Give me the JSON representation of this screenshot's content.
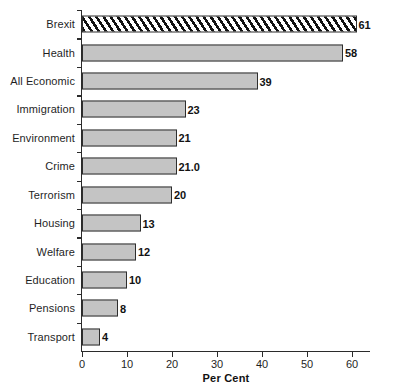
{
  "chart_data": {
    "type": "bar",
    "orientation": "horizontal",
    "title": "",
    "xlabel": "Per Cent",
    "ylabel": "",
    "categories": [
      "Brexit",
      "Health",
      "All Economic",
      "Immigration",
      "Environment",
      "Crime",
      "Terrorism",
      "Housing",
      "Welfare",
      "Education",
      "Pensions",
      "Transport"
    ],
    "values": [
      61,
      58,
      39,
      23,
      21,
      21.0,
      20,
      13,
      12,
      10,
      8,
      4
    ],
    "value_labels": [
      "61",
      "58",
      "39",
      "23",
      "21",
      "21.0",
      "20",
      "13",
      "12",
      "10",
      "8",
      "4"
    ],
    "xlim": [
      0,
      64
    ],
    "xticks": [
      0,
      10,
      20,
      30,
      40,
      50,
      60
    ],
    "xtick_labels": [
      "0",
      "10",
      "20",
      "30",
      "40",
      "50",
      "60"
    ],
    "grid": false,
    "legend": null,
    "bar_styles": [
      "hatched",
      "solid",
      "solid",
      "solid",
      "solid",
      "solid",
      "solid",
      "solid",
      "solid",
      "solid",
      "solid",
      "solid"
    ],
    "colors": {
      "bar_fill": "#c4c4c4",
      "bar_border": "#2e2e2e",
      "hatch_stroke": "#111111",
      "axis": "#2b2b2b",
      "text": "#1f1f1f",
      "background": "#ffffff"
    }
  }
}
